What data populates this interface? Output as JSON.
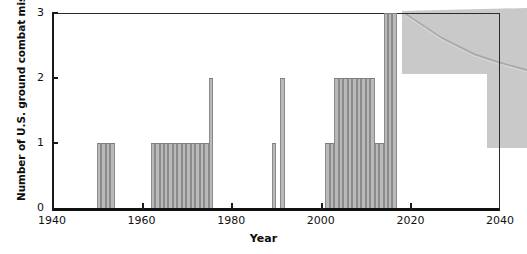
{
  "chart_data": {
    "type": "bar",
    "title": "",
    "subtitle": "",
    "xlabel": "Year",
    "ylabel": "Number of U.S. ground combat missions",
    "xlim": [
      1940,
      2040
    ],
    "ylim": [
      0,
      3
    ],
    "grid": false,
    "legend": "none",
    "xticks": [
      1940,
      1960,
      1980,
      2000,
      2020,
      2040
    ],
    "xtick_labels": [
      "1940",
      "1960",
      "1980",
      "2000",
      "2020",
      "2040"
    ],
    "yticks": [
      0,
      1,
      2,
      3
    ],
    "ytick_labels": [
      "0",
      "1",
      "2",
      "3"
    ],
    "bin_width": 1,
    "bar_fill": "#b9b9b9",
    "bar_edge": "#8a8a8a",
    "axis_color": "#111111",
    "categories": [
      1950,
      1951,
      1952,
      1953,
      1962,
      1963,
      1964,
      1965,
      1966,
      1967,
      1968,
      1969,
      1970,
      1971,
      1972,
      1973,
      1974,
      1975,
      1989,
      1991,
      2001,
      2002,
      2003,
      2004,
      2005,
      2006,
      2007,
      2008,
      2009,
      2010,
      2011,
      2012,
      2013,
      2014,
      2015,
      2016
    ],
    "values": [
      1,
      1,
      1,
      1,
      1,
      1,
      1,
      1,
      1,
      1,
      1,
      1,
      1,
      1,
      1,
      1,
      1,
      2,
      1,
      2,
      1,
      1,
      2,
      2,
      2,
      2,
      2,
      2,
      2,
      2,
      2,
      1,
      1,
      3,
      3,
      3
    ],
    "annotations": []
  },
  "artifact": {
    "name": "scan-smudge",
    "color": "#c9c9c9",
    "crease_color": "#a9a9a9",
    "description": "gray photocopy shadow with diagonal crease line at upper right"
  }
}
